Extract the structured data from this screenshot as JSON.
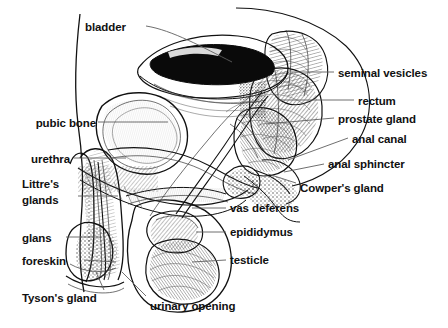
{
  "diagram": {
    "style": "black and white engraved line drawing",
    "background_color": "#ffffff",
    "ink_color": "#111111",
    "leader_line_color": "#5f5f5f",
    "width": 448,
    "height": 328
  },
  "labels": {
    "bladder": "bladder",
    "pubic_bone": "pubic bone",
    "urethra": "urethra",
    "littres_glands_line1": "Littre's",
    "littres_glands_line2": "glands",
    "glans": "glans",
    "foreskin": "foreskin",
    "tysons_gland": "Tyson's gland",
    "urinary_opening": "urinary opening",
    "seminal_vesicles": "seminal vesicles",
    "rectum": "rectum",
    "prostate_gland": "prostate gland",
    "anal_canal": "anal canal",
    "anal_sphincter": "anal sphincter",
    "cowpers_gland": "Cowper's gland",
    "vas_deferens": "vas deferens",
    "epididymus": "epididymus",
    "testicle": "testicle"
  },
  "structures": [
    {
      "name": "bladder",
      "side": "left",
      "label_x": 85,
      "label_y": 20
    },
    {
      "name": "pubic-bone",
      "side": "left",
      "label_x": 22,
      "label_y": 116
    },
    {
      "name": "urethra",
      "side": "left",
      "label_x": 22,
      "label_y": 152
    },
    {
      "name": "littres-glands",
      "side": "left",
      "label_x": 22,
      "label_y": 177
    },
    {
      "name": "glans",
      "side": "left",
      "label_x": 22,
      "label_y": 231
    },
    {
      "name": "foreskin",
      "side": "left",
      "label_x": 22,
      "label_y": 255
    },
    {
      "name": "tysons-gland",
      "side": "left",
      "label_x": 22,
      "label_y": 292
    },
    {
      "name": "urinary-opening",
      "side": "bottom",
      "label_x": 150,
      "label_y": 300
    },
    {
      "name": "seminal-vesicles",
      "side": "right",
      "label_x": 338,
      "label_y": 67
    },
    {
      "name": "rectum",
      "side": "right",
      "label_x": 358,
      "label_y": 95
    },
    {
      "name": "prostate-gland",
      "side": "right",
      "label_x": 338,
      "label_y": 113
    },
    {
      "name": "anal-canal",
      "side": "right",
      "label_x": 352,
      "label_y": 133
    },
    {
      "name": "anal-sphincter",
      "side": "right",
      "label_x": 328,
      "label_y": 158
    },
    {
      "name": "cowpers-gland",
      "side": "right",
      "label_x": 300,
      "label_y": 182
    },
    {
      "name": "vas-deferens",
      "side": "right",
      "label_x": 230,
      "label_y": 202
    },
    {
      "name": "epididymus",
      "side": "right",
      "label_x": 230,
      "label_y": 226
    },
    {
      "name": "testicle",
      "side": "right",
      "label_x": 230,
      "label_y": 254
    }
  ]
}
